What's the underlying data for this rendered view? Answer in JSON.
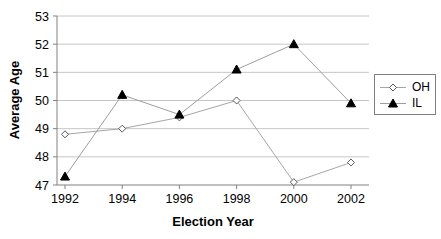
{
  "chart_data": {
    "type": "line",
    "title": "",
    "xlabel": "Election Year",
    "ylabel": "Average Age",
    "categories": [
      "1992",
      "1994",
      "1996",
      "1998",
      "2000",
      "2002"
    ],
    "ylim": [
      47,
      53
    ],
    "ytick_step": 1,
    "grid": true,
    "legend_position": "right",
    "colors": {
      "gridline": "#c6c6c6",
      "axis": "#808080",
      "text": "#000000"
    },
    "series": [
      {
        "name": "OH",
        "marker": "open-diamond",
        "line_color": "#a6a6a6",
        "marker_color": "#595959",
        "values": [
          48.8,
          49.0,
          49.4,
          50.0,
          47.1,
          47.8
        ]
      },
      {
        "name": "IL",
        "marker": "filled-triangle",
        "line_color": "#9e9e9e",
        "marker_color": "#000000",
        "values": [
          47.3,
          50.2,
          49.5,
          51.1,
          52.0,
          49.9
        ]
      }
    ]
  }
}
